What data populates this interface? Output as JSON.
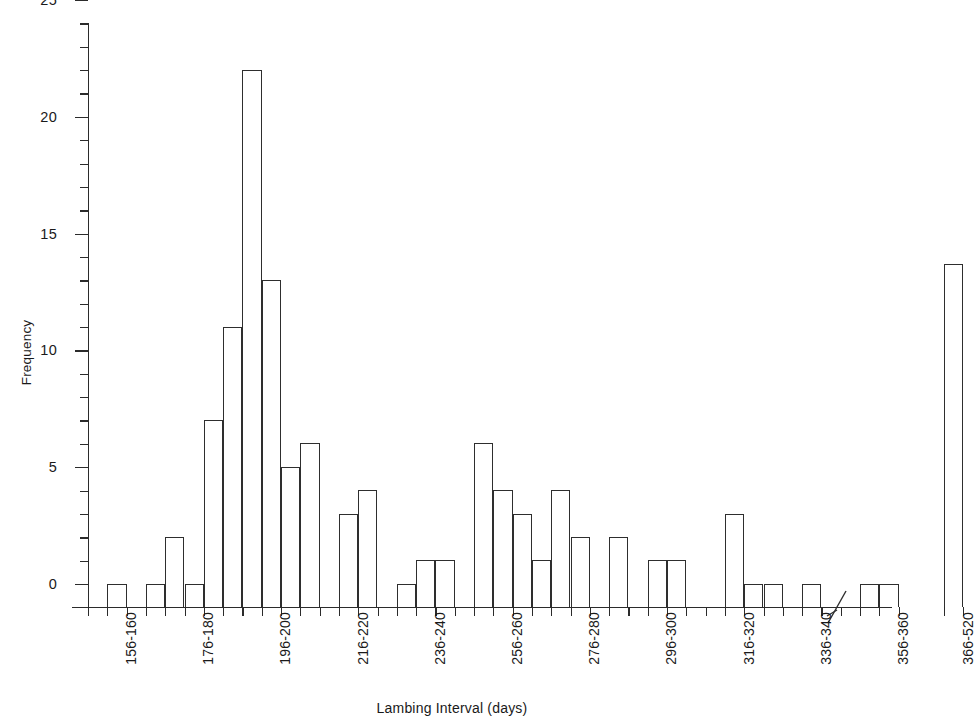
{
  "chart_data": {
    "type": "bar",
    "title": "",
    "xlabel": "Lambing Interval (days)",
    "ylabel": "Frequency",
    "ylim": [
      0,
      25
    ],
    "ytick_values": [
      0,
      5,
      10,
      15,
      20,
      25
    ],
    "ytick_labels": [
      "0",
      "5",
      "10",
      "15",
      "20",
      "25"
    ],
    "yminor_step": 1,
    "grid": false,
    "legend": null,
    "axis_break": {
      "present": true,
      "position_label": "between 356-360 and 366-520",
      "symbol": "//"
    },
    "bin_width_days": 5,
    "categories": [
      "151-155",
      "156-160",
      "161-165",
      "166-170",
      "171-175",
      "176-180",
      "181-185",
      "186-190",
      "191-195",
      "196-200",
      "201-205",
      "206-210",
      "211-215",
      "216-220",
      "221-225",
      "226-230",
      "231-235",
      "236-240",
      "241-245",
      "246-250",
      "251-255",
      "256-260",
      "261-265",
      "266-270",
      "271-275",
      "276-280",
      "281-285",
      "286-290",
      "291-295",
      "296-300",
      "301-305",
      "306-310",
      "311-315",
      "316-320",
      "321-325",
      "326-330",
      "331-335",
      "336-340",
      "341-345",
      "346-350",
      "351-355",
      "356-360",
      "361-365",
      "366-520"
    ],
    "values": [
      0,
      1,
      0,
      1,
      3,
      1,
      8,
      12,
      23,
      14,
      6,
      7,
      0,
      4,
      5,
      0,
      1,
      2,
      2,
      0,
      7,
      5,
      4,
      2,
      5,
      3,
      0,
      3,
      0,
      2,
      2,
      0,
      0,
      4,
      1,
      1,
      0,
      1,
      0,
      0,
      1,
      1,
      0,
      14.7
    ],
    "labeled_ticks": [
      "156-160",
      "176-180",
      "196-200",
      "216-220",
      "236-240",
      "256-260",
      "276-280",
      "296-300",
      "316-320",
      "336-340",
      "356-360",
      "366-520"
    ]
  },
  "axis": {
    "y_title": "Frequency",
    "x_title": "Lambing Interval (days)"
  }
}
